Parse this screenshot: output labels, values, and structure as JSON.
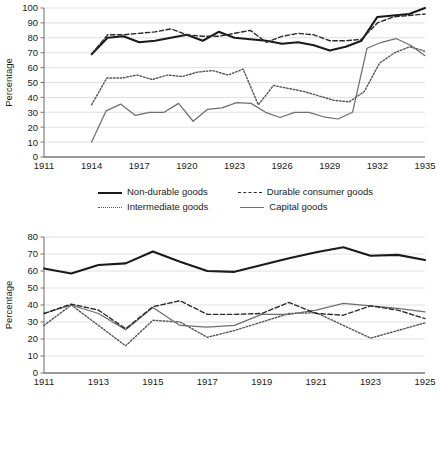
{
  "figure": {
    "axis_label_y": "Percentage",
    "colors": {
      "non_durable": "#1a1a1a",
      "durable": "#2b2b2b",
      "intermediate": "#555555",
      "capital": "#6e6e6e",
      "grid": "#d8d8d8",
      "axis": "#777777"
    }
  },
  "chart_data": [
    {
      "id": "top",
      "type": "line",
      "title": "",
      "xlabel": "",
      "ylabel": "Percentage",
      "xlim": [
        1911,
        1935
      ],
      "ylim": [
        0,
        100
      ],
      "grid": true,
      "legend_position": "bottom",
      "xticks": [
        1911,
        1914,
        1917,
        1920,
        1923,
        1926,
        1929,
        1932,
        1935
      ],
      "yticks": [
        0,
        10,
        20,
        30,
        40,
        50,
        60,
        70,
        80,
        90,
        100
      ],
      "x": [
        1914,
        1915,
        1916,
        1917,
        1918,
        1919,
        1920,
        1921,
        1922,
        1923,
        1924,
        1925,
        1926,
        1927,
        1928,
        1929,
        1930,
        1931,
        1932,
        1933,
        1934,
        1935
      ],
      "series": [
        {
          "name": "Non-durable goods",
          "style": "solid-bold",
          "values": [
            69,
            80,
            81,
            77,
            78,
            80,
            82,
            78,
            84,
            80,
            79,
            78,
            76,
            77,
            75,
            71.5,
            74,
            78,
            94,
            95,
            96,
            100
          ]
        },
        {
          "name": "Durable consumer goods",
          "style": "dashed",
          "values": [
            69,
            82,
            82,
            83,
            84,
            86,
            82,
            81,
            81,
            83,
            85,
            77,
            81,
            83,
            82,
            78,
            78,
            79,
            90,
            94,
            95,
            96
          ]
        },
        {
          "name": "Intermediate goods",
          "style": "dotted",
          "values": [
            35,
            53,
            53,
            55,
            52,
            55,
            54,
            57,
            58,
            55,
            59,
            35,
            48,
            46,
            44,
            41,
            38,
            37,
            44,
            63,
            70,
            74,
            71
          ]
        },
        {
          "name": "Capital goods",
          "style": "solid-thin",
          "values": [
            10,
            31,
            35.5,
            28,
            30,
            30,
            36,
            24,
            32,
            33,
            36.5,
            36,
            30,
            26.5,
            30,
            30,
            27,
            25.5,
            30,
            73,
            77,
            79.5,
            75,
            68
          ]
        }
      ]
    },
    {
      "id": "bottom",
      "type": "line",
      "title": "",
      "xlabel": "",
      "ylabel": "Percentage",
      "xlim": [
        1911,
        1925
      ],
      "ylim": [
        0,
        80
      ],
      "grid": true,
      "legend_position": "bottom",
      "xticks": [
        1911,
        1913,
        1915,
        1917,
        1919,
        1921,
        1923,
        1925
      ],
      "yticks": [
        0,
        10,
        20,
        30,
        40,
        50,
        60,
        70,
        80
      ],
      "x": [
        1911,
        1912,
        1913,
        1914,
        1915,
        1916,
        1917,
        1918,
        1919,
        1920,
        1921,
        1922,
        1923,
        1924,
        1925
      ],
      "series": [
        {
          "name": "Non-durable consumer goods",
          "style": "solid-bold",
          "values": [
            61.5,
            58.5,
            63.5,
            64.5,
            71.5,
            65.5,
            60,
            59.5,
            63.5,
            67.5,
            71,
            74,
            69,
            69.5,
            66.5
          ]
        },
        {
          "name": "Durable consumer goods",
          "style": "dotted",
          "values": [
            28,
            40,
            28,
            16,
            31,
            30,
            21,
            25,
            30,
            35,
            35.5,
            28,
            20.5,
            25,
            29.5
          ]
        },
        {
          "name": "Intermediate goods",
          "style": "solid-thin",
          "values": [
            35,
            40,
            35,
            25.5,
            38.5,
            28,
            27,
            28,
            34.5,
            34.5,
            37,
            41,
            39.5,
            38,
            36
          ]
        },
        {
          "name": "Capital goods",
          "style": "dashed",
          "values": [
            35,
            40.5,
            37,
            26,
            39,
            42.5,
            34.5,
            34.5,
            35,
            41.5,
            35,
            34,
            39.5,
            37,
            32
          ]
        }
      ]
    }
  ],
  "legends": {
    "top": [
      {
        "label": "Non-durable goods",
        "style": "solid-bold"
      },
      {
        "label": "Durable consumer goods",
        "style": "dashed"
      },
      {
        "label": "Intermediate goods",
        "style": "dotted"
      },
      {
        "label": "Capital goods",
        "style": "solid-thin"
      }
    ],
    "bottom": [
      {
        "label": "Non-durable consumer goods",
        "style": "solid-bold"
      },
      {
        "label": "Durable consumer goods",
        "style": "dotted"
      },
      {
        "label": "Intermediate goods",
        "style": "solid-thin"
      },
      {
        "label": "Capital goods",
        "style": "dashed"
      }
    ]
  }
}
